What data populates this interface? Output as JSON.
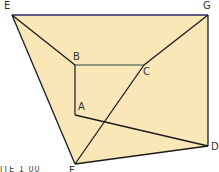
{
  "diagram": {
    "fill_color": "#f9e7b8",
    "line_color": "#1a1a1a",
    "top_edge_color": "#2a2a6a",
    "points": {
      "E": {
        "label": "E",
        "x": 12,
        "y": 15
      },
      "G": {
        "label": "G",
        "x": 208,
        "y": 15
      },
      "B": {
        "label": "B",
        "x": 75,
        "y": 65
      },
      "C": {
        "label": "C",
        "x": 144,
        "y": 65
      },
      "A": {
        "label": "A",
        "x": 75,
        "y": 115
      },
      "D": {
        "label": "D",
        "x": 208,
        "y": 146
      },
      "F": {
        "label": "F",
        "x": 75,
        "y": 164
      }
    },
    "segments": [
      "EG",
      "GD",
      "DF",
      "FE",
      "EB",
      "BC",
      "BA",
      "CG",
      "CF",
      "AD"
    ],
    "cut_text": "ITE 1 00"
  }
}
